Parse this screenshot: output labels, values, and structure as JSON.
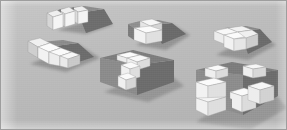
{
  "scene": {
    "title": "Isometric polycube blocks rendering",
    "width": 287,
    "height": 130,
    "background_color": "#bdbdbd",
    "border_color": "#9e9e9e",
    "object_count": 6,
    "palette": {
      "background": "#bdbdbd",
      "cube_top": "#f2f2f2",
      "cube_left": "#e0e0e0",
      "cube_right": "#b0b0b0",
      "block_top": "#8a8a8a",
      "block_left": "#9a9a9a",
      "block_right": "#6e6e6e",
      "shadow": "#8e8e8e",
      "outline": "#5a5a5a"
    },
    "objects": [
      {
        "id": "object-1",
        "name": "top-left-cube-row",
        "label": "Row of three cubes",
        "cube_count": 3,
        "position": {
          "x": 45,
          "y": 8
        },
        "has_shadow": true
      },
      {
        "id": "object-2",
        "name": "left-l-shape",
        "label": "L-shaped cube cluster",
        "cube_count": 4,
        "position": {
          "x": 12,
          "y": 38
        },
        "has_shadow": true
      },
      {
        "id": "object-3",
        "name": "center-top-pair",
        "label": "Cube pair on slab",
        "cube_count": 3,
        "position": {
          "x": 124,
          "y": 14
        },
        "has_shadow": true
      },
      {
        "id": "object-4",
        "name": "center-big-block",
        "label": "Dark block with white zigzag cubes",
        "cube_count": 4,
        "position": {
          "x": 98,
          "y": 46
        },
        "has_shadow": true
      },
      {
        "id": "object-5",
        "name": "right-top-quad",
        "label": "Four cube square on block",
        "cube_count": 4,
        "position": {
          "x": 206,
          "y": 26
        },
        "has_shadow": true
      },
      {
        "id": "object-6",
        "name": "bottom-right-wide-block",
        "label": "Wide block with scattered white cubes",
        "cube_count": 6,
        "position": {
          "x": 190,
          "y": 62
        },
        "has_shadow": true
      }
    ]
  }
}
